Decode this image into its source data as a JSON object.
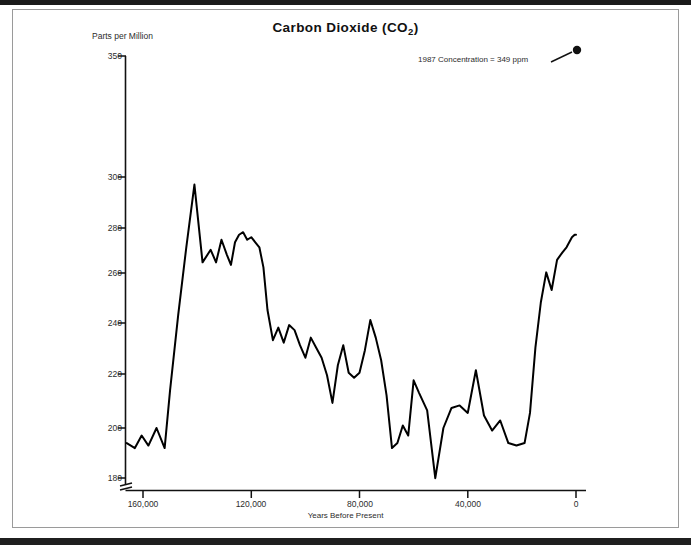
{
  "chart_data": {
    "type": "line",
    "title": "Carbon Dioxide (CO2)",
    "title_main": "Carbon Dioxide (CO",
    "title_sub": "2",
    "title_tail": ")",
    "ylabel": "Parts per Million",
    "xlabel": "Years Before Present",
    "ylim": [
      180,
      350
    ],
    "xlim": [
      170000,
      -5000
    ],
    "y_axis_break": true,
    "y_axis_break_note": "axis break between 180 and the baseline; 350 separated from 300 by gap",
    "grid": false,
    "legend": "none",
    "line_color": "#000000",
    "yticks": [
      350,
      300,
      280,
      260,
      240,
      220,
      200,
      180
    ],
    "ytick_labels": [
      "350",
      "300",
      "280",
      "260",
      "240",
      "220",
      "200",
      "180"
    ],
    "xticks": [
      160000,
      120000,
      80000,
      40000,
      0
    ],
    "xtick_labels": [
      "160,000",
      "120,000",
      "80,000",
      "40,000",
      "0"
    ],
    "annotation": {
      "text": "1987 Concentration  =  349 ppm",
      "point_x": 0,
      "point_y": 349,
      "marker": "filled-circle"
    },
    "x": [
      166000,
      163000,
      160500,
      158000,
      155000,
      152000,
      150000,
      147000,
      144000,
      141000,
      138000,
      135000,
      133000,
      131000,
      129000,
      127500,
      126000,
      124500,
      123000,
      121500,
      120000,
      118500,
      117000,
      115500,
      114000,
      112000,
      110000,
      108000,
      106000,
      104000,
      102000,
      100000,
      98000,
      96000,
      94000,
      92000,
      90000,
      88000,
      86000,
      84000,
      82000,
      80000,
      78000,
      76000,
      74000,
      72000,
      70000,
      68000,
      66000,
      64000,
      62000,
      60000,
      58000,
      55000,
      52000,
      49000,
      46000,
      43000,
      40000,
      37000,
      34000,
      31000,
      28000,
      25000,
      22000,
      19000,
      17000,
      15000,
      13000,
      11000,
      9000,
      7000,
      5000,
      3500,
      2500,
      1500,
      500,
      0
    ],
    "y": [
      194,
      192,
      197,
      193,
      200,
      192,
      215,
      245,
      272,
      297,
      266,
      271,
      266,
      275,
      269,
      265,
      274,
      277,
      278,
      275,
      276,
      274,
      272,
      264,
      247,
      235,
      240,
      234,
      241,
      239,
      233,
      228,
      236,
      232,
      228,
      221,
      210,
      225,
      233,
      222,
      220,
      222,
      231,
      243,
      236,
      227,
      213,
      192,
      194,
      201,
      197,
      219,
      214,
      207,
      180,
      200,
      208,
      209,
      206,
      223,
      205,
      199,
      203,
      194,
      193,
      194,
      206,
      232,
      250,
      262,
      255,
      267,
      270,
      272,
      274,
      276,
      277,
      277
    ]
  },
  "figure": {
    "background": "#ffffff",
    "frame_color": "#9a9a9a"
  }
}
